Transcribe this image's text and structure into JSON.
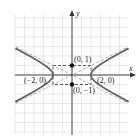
{
  "chart_data": {
    "type": "line",
    "title": "",
    "equation": "x^2/4 - y^2 = 1",
    "xlabel": "x",
    "ylabel": "y",
    "xlim": [
      -6,
      6
    ],
    "ylim": [
      -6,
      6
    ],
    "grid": true,
    "series": [
      {
        "name": "hyperbola-right-branch",
        "style": "solid",
        "color": "#666666"
      },
      {
        "name": "hyperbola-left-branch",
        "style": "solid",
        "color": "#666666"
      },
      {
        "name": "asymptote y = x/2",
        "style": "dashed",
        "color": "#888888"
      },
      {
        "name": "asymptote y = -x/2",
        "style": "dashed",
        "color": "#888888"
      },
      {
        "name": "fundamental-rectangle",
        "style": "dashed",
        "color": "#333333",
        "corners": [
          [
            -2,
            1
          ],
          [
            2,
            1
          ],
          [
            2,
            -1
          ],
          [
            -2,
            -1
          ]
        ]
      }
    ],
    "points": [
      {
        "label": "(0, 1)",
        "x": 0,
        "y": 1,
        "marker": "filled"
      },
      {
        "label": "(0, −1)",
        "x": 0,
        "y": -1,
        "marker": "filled"
      },
      {
        "label": "(−2, 0)",
        "x": -2,
        "y": 0,
        "marker": "vertex"
      },
      {
        "label": "(2, 0)",
        "x": 2,
        "y": 0,
        "marker": "vertex"
      }
    ]
  },
  "labels": {
    "x_axis": "x",
    "y_axis": "y",
    "point_top": "(0, 1)",
    "point_bottom": "(0, −1)",
    "vertex_left": "(−2, 0)",
    "vertex_right": "(2, 0)"
  },
  "colors": {
    "grid": "#d9d9d9",
    "axis": "#333333",
    "curve": "#666666",
    "asymptote": "#999999"
  }
}
